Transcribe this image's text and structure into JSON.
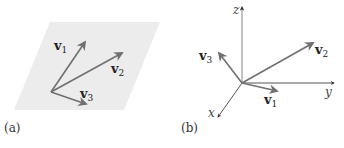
{
  "figure": {
    "colors": {
      "plane_fill": "#ececec",
      "vector": "#707070",
      "axis": "#555555",
      "text": "#222222"
    },
    "panel_a": {
      "caption": "(a)",
      "description": "Three vectors lying in a common plane",
      "vectors": [
        {
          "name": "v",
          "sub": "1"
        },
        {
          "name": "v",
          "sub": "2"
        },
        {
          "name": "v",
          "sub": "3"
        }
      ]
    },
    "panel_b": {
      "caption": "(b)",
      "description": "Three vectors in 3D space with coordinate axes",
      "axes": [
        "x",
        "y",
        "z"
      ],
      "vectors": [
        {
          "name": "v",
          "sub": "1"
        },
        {
          "name": "v",
          "sub": "2"
        },
        {
          "name": "v",
          "sub": "3"
        }
      ]
    }
  }
}
